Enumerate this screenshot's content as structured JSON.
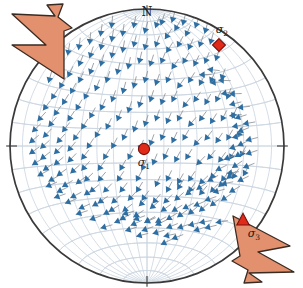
{
  "figure": {
    "type": "stereonet",
    "projection": "equal-area lower hemisphere",
    "background_color": "#ffffff",
    "title": ""
  },
  "net": {
    "center_x": 147,
    "center_y": 146,
    "radius": 137,
    "outline_color": "#3a3a3a",
    "grid_color": "#c9d4df",
    "grid_spacing_deg": 10,
    "fill_color": "#ffffff"
  },
  "orientation_labels": {
    "north": "N",
    "north_tick": true,
    "south_tick": true,
    "east_tick": true,
    "west_tick": true
  },
  "stress_axes": [
    {
      "id": "sigma1",
      "label": "σ",
      "subscript": "1",
      "marker": "circle",
      "color": "#e02b1a",
      "edge_color": "#7a1008",
      "x": 144,
      "y": 149,
      "size": 9,
      "label_x": 144,
      "label_y": 166
    },
    {
      "id": "sigma2",
      "label": "σ",
      "subscript": "2",
      "marker": "diamond",
      "color": "#e02b1a",
      "edge_color": "#7a1008",
      "x": 219,
      "y": 45,
      "size": 9,
      "label_x": 222,
      "label_y": 33
    },
    {
      "id": "sigma3",
      "label": "σ",
      "subscript": "3",
      "marker": "triangle",
      "color": "#e02b1a",
      "edge_color": "#7a1008",
      "x": 243,
      "y": 220,
      "size": 10,
      "label_x": 254,
      "label_y": 237
    }
  ],
  "extension_arrows": [
    {
      "id": "arrow-nw",
      "direction": "northwest",
      "fill_color": "#e2906d",
      "edge_color": "#3a2b22",
      "points": "64,79 12,45 46,45 12,14 55,16 47,5 63,4 58,17 72,28 64,31"
    },
    {
      "id": "arrow-se",
      "direction": "southeast",
      "fill_color": "#e2906d",
      "edge_color": "#3a2b22",
      "points": "233,216 290,246 258,252 294,272 249,273 262,282 244,283 248,270 232,261 240,256"
    }
  ],
  "slip_vectors": {
    "count": 252,
    "arrow_head_color": "#2d6ea3",
    "tail_color": "#8a8f96",
    "description": "Blue slip / displacement vectors on lower-hemisphere projection, radiating away from sigma-1 toward the NW and SE extension directions"
  },
  "chart_data": {
    "type": "scatter",
    "title": "",
    "xlabel": "",
    "ylabel": "",
    "grid": true,
    "legend": "none",
    "vectors": [
      [
        0.42,
        0.82,
        196
      ],
      [
        0.35,
        0.86,
        200
      ],
      [
        0.28,
        0.8,
        205
      ],
      [
        0.2,
        0.84,
        210
      ],
      [
        0.13,
        0.78,
        214
      ],
      [
        0.06,
        0.86,
        200
      ],
      [
        -0.02,
        0.82,
        196
      ],
      [
        -0.1,
        0.86,
        192
      ],
      [
        -0.18,
        0.8,
        188
      ],
      [
        -0.26,
        0.76,
        190
      ],
      [
        -0.34,
        0.7,
        194
      ],
      [
        -0.42,
        0.64,
        198
      ],
      [
        -0.5,
        0.58,
        202
      ],
      [
        -0.58,
        0.5,
        206
      ],
      [
        -0.64,
        0.42,
        210
      ],
      [
        -0.7,
        0.34,
        214
      ],
      [
        -0.76,
        0.26,
        218
      ],
      [
        -0.8,
        0.18,
        222
      ],
      [
        -0.84,
        0.1,
        226
      ],
      [
        -0.86,
        0.02,
        230
      ],
      [
        -0.86,
        -0.06,
        234
      ],
      [
        -0.84,
        -0.14,
        238
      ],
      [
        -0.8,
        -0.22,
        242
      ],
      [
        -0.74,
        -0.3,
        246
      ],
      [
        -0.68,
        -0.38,
        250
      ],
      [
        0.46,
        0.74,
        196
      ],
      [
        0.38,
        0.72,
        200
      ],
      [
        0.3,
        0.7,
        204
      ],
      [
        0.22,
        0.72,
        208
      ],
      [
        0.14,
        0.68,
        212
      ],
      [
        0.06,
        0.72,
        200
      ],
      [
        -0.02,
        0.7,
        196
      ],
      [
        -0.1,
        0.72,
        194
      ],
      [
        -0.18,
        0.68,
        190
      ],
      [
        -0.26,
        0.64,
        192
      ],
      [
        -0.34,
        0.58,
        196
      ],
      [
        -0.42,
        0.52,
        200
      ],
      [
        -0.5,
        0.46,
        204
      ],
      [
        -0.56,
        0.38,
        208
      ],
      [
        -0.62,
        0.3,
        212
      ],
      [
        -0.68,
        0.22,
        216
      ],
      [
        -0.72,
        0.14,
        220
      ],
      [
        -0.76,
        0.06,
        224
      ],
      [
        -0.78,
        -0.02,
        228
      ],
      [
        -0.78,
        -0.1,
        232
      ],
      [
        -0.76,
        -0.18,
        236
      ],
      [
        -0.72,
        -0.26,
        240
      ],
      [
        -0.66,
        -0.34,
        244
      ],
      [
        -0.6,
        -0.42,
        248
      ],
      [
        -0.52,
        -0.5,
        252
      ],
      [
        0.5,
        0.62,
        198
      ],
      [
        0.42,
        0.6,
        202
      ],
      [
        0.34,
        0.58,
        206
      ],
      [
        0.26,
        0.6,
        210
      ],
      [
        0.18,
        0.56,
        214
      ],
      [
        0.1,
        0.6,
        202
      ],
      [
        0.02,
        0.58,
        198
      ],
      [
        -0.06,
        0.6,
        194
      ],
      [
        -0.14,
        0.56,
        192
      ],
      [
        -0.22,
        0.52,
        194
      ],
      [
        -0.3,
        0.46,
        198
      ],
      [
        -0.38,
        0.4,
        202
      ],
      [
        -0.46,
        0.34,
        206
      ],
      [
        -0.52,
        0.26,
        210
      ],
      [
        -0.58,
        0.18,
        214
      ],
      [
        -0.62,
        0.1,
        218
      ],
      [
        -0.66,
        0.02,
        222
      ],
      [
        -0.68,
        -0.06,
        226
      ],
      [
        -0.68,
        -0.14,
        230
      ],
      [
        -0.66,
        -0.22,
        234
      ],
      [
        -0.62,
        -0.3,
        238
      ],
      [
        -0.56,
        -0.38,
        242
      ],
      [
        -0.5,
        -0.46,
        246
      ],
      [
        -0.42,
        -0.54,
        250
      ],
      [
        -0.34,
        -0.6,
        254
      ],
      [
        0.54,
        0.48,
        200
      ],
      [
        0.46,
        0.46,
        204
      ],
      [
        0.38,
        0.44,
        208
      ],
      [
        0.3,
        0.46,
        212
      ],
      [
        0.22,
        0.42,
        216
      ],
      [
        0.14,
        0.46,
        204
      ],
      [
        0.06,
        0.44,
        200
      ],
      [
        -0.02,
        0.46,
        196
      ],
      [
        -0.1,
        0.42,
        194
      ],
      [
        -0.18,
        0.38,
        196
      ],
      [
        -0.26,
        0.32,
        200
      ],
      [
        -0.34,
        0.26,
        204
      ],
      [
        -0.42,
        0.2,
        208
      ],
      [
        -0.48,
        0.12,
        212
      ],
      [
        -0.54,
        0.04,
        216
      ],
      [
        -0.58,
        -0.04,
        220
      ],
      [
        -0.58,
        -0.12,
        224
      ],
      [
        -0.56,
        -0.2,
        228
      ],
      [
        -0.52,
        -0.28,
        232
      ],
      [
        -0.46,
        -0.36,
        236
      ],
      [
        -0.4,
        -0.44,
        240
      ],
      [
        -0.32,
        -0.5,
        244
      ],
      [
        -0.24,
        -0.56,
        248
      ],
      [
        -0.16,
        -0.62,
        252
      ],
      [
        -0.08,
        -0.66,
        256
      ],
      [
        0.58,
        0.34,
        202
      ],
      [
        0.5,
        0.32,
        206
      ],
      [
        0.42,
        0.3,
        210
      ],
      [
        0.34,
        0.32,
        214
      ],
      [
        0.26,
        0.28,
        218
      ],
      [
        0.18,
        0.32,
        206
      ],
      [
        0.1,
        0.3,
        202
      ],
      [
        0.02,
        0.32,
        198
      ],
      [
        -0.06,
        0.28,
        196
      ],
      [
        -0.14,
        0.24,
        198
      ],
      [
        -0.22,
        0.18,
        202
      ],
      [
        -0.3,
        0.12,
        206
      ],
      [
        -0.38,
        0.06,
        210
      ],
      [
        -0.44,
        -0.02,
        214
      ],
      [
        -0.48,
        -0.1,
        218
      ],
      [
        -0.48,
        -0.18,
        222
      ],
      [
        -0.46,
        -0.26,
        226
      ],
      [
        -0.42,
        -0.34,
        230
      ],
      [
        -0.36,
        -0.42,
        234
      ],
      [
        -0.28,
        -0.48,
        238
      ],
      [
        -0.2,
        -0.54,
        242
      ],
      [
        -0.12,
        -0.58,
        246
      ],
      [
        -0.04,
        -0.62,
        250
      ],
      [
        0.04,
        -0.64,
        254
      ],
      [
        0.12,
        -0.66,
        258
      ],
      [
        0.62,
        0.2,
        204
      ],
      [
        0.54,
        0.18,
        208
      ],
      [
        0.46,
        0.16,
        212
      ],
      [
        0.38,
        0.18,
        216
      ],
      [
        0.3,
        0.14,
        220
      ],
      [
        0.22,
        0.18,
        208
      ],
      [
        0.14,
        0.16,
        204
      ],
      [
        0.06,
        0.18,
        200
      ],
      [
        -0.02,
        0.14,
        198
      ],
      [
        -0.1,
        0.1,
        200
      ],
      [
        -0.18,
        0.04,
        204
      ],
      [
        -0.26,
        -0.02,
        208
      ],
      [
        -0.32,
        -0.1,
        212
      ],
      [
        -0.36,
        -0.18,
        216
      ],
      [
        -0.36,
        -0.26,
        220
      ],
      [
        -0.32,
        -0.34,
        224
      ],
      [
        -0.26,
        -0.42,
        228
      ],
      [
        -0.18,
        -0.48,
        232
      ],
      [
        -0.1,
        -0.52,
        236
      ],
      [
        -0.02,
        -0.56,
        240
      ],
      [
        0.06,
        -0.58,
        244
      ],
      [
        0.14,
        -0.6,
        248
      ],
      [
        0.22,
        -0.6,
        252
      ],
      [
        0.3,
        -0.58,
        256
      ],
      [
        0.38,
        -0.56,
        260
      ],
      [
        0.66,
        0.06,
        206
      ],
      [
        0.58,
        0.04,
        210
      ],
      [
        0.5,
        0.02,
        214
      ],
      [
        0.42,
        0.04,
        218
      ],
      [
        0.34,
        0.0,
        222
      ],
      [
        0.26,
        0.04,
        210
      ],
      [
        0.18,
        0.02,
        206
      ],
      [
        0.1,
        0.04,
        202
      ],
      [
        0.02,
        0.0,
        200
      ],
      [
        -0.06,
        -0.04,
        202
      ],
      [
        -0.14,
        -0.1,
        206
      ],
      [
        -0.2,
        -0.18,
        210
      ],
      [
        -0.22,
        -0.26,
        214
      ],
      [
        -0.2,
        -0.34,
        218
      ],
      [
        -0.14,
        -0.4,
        222
      ],
      [
        -0.06,
        -0.44,
        226
      ],
      [
        0.02,
        -0.46,
        230
      ],
      [
        0.1,
        -0.48,
        234
      ],
      [
        0.18,
        -0.48,
        238
      ],
      [
        0.26,
        -0.46,
        242
      ],
      [
        0.34,
        -0.44,
        246
      ],
      [
        0.42,
        -0.4,
        250
      ],
      [
        0.48,
        -0.34,
        254
      ],
      [
        0.54,
        -0.28,
        258
      ],
      [
        0.58,
        -0.2,
        262
      ],
      [
        0.68,
        -0.08,
        208
      ],
      [
        0.6,
        -0.1,
        212
      ],
      [
        0.52,
        -0.12,
        216
      ],
      [
        0.44,
        -0.1,
        220
      ],
      [
        0.36,
        -0.14,
        224
      ],
      [
        0.28,
        -0.1,
        212
      ],
      [
        0.2,
        -0.12,
        208
      ],
      [
        0.12,
        -0.1,
        204
      ],
      [
        0.04,
        -0.14,
        202
      ],
      [
        -0.04,
        -0.18,
        204
      ],
      [
        -0.08,
        -0.26,
        208
      ],
      [
        -0.08,
        -0.34,
        212
      ],
      [
        -0.04,
        -0.4,
        216
      ],
      [
        0.04,
        -0.42,
        220
      ],
      [
        0.12,
        -0.42,
        224
      ],
      [
        0.2,
        -0.4,
        228
      ],
      [
        0.28,
        -0.36,
        232
      ],
      [
        0.36,
        -0.32,
        236
      ],
      [
        0.44,
        -0.26,
        240
      ],
      [
        0.5,
        -0.18,
        244
      ],
      [
        0.56,
        -0.1,
        248
      ],
      [
        0.6,
        -0.02,
        252
      ],
      [
        0.62,
        0.06,
        256
      ],
      [
        0.62,
        0.14,
        260
      ],
      [
        0.6,
        0.22,
        264
      ],
      [
        0.7,
        -0.22,
        210
      ],
      [
        0.62,
        -0.24,
        214
      ],
      [
        0.54,
        -0.26,
        218
      ],
      [
        0.46,
        -0.24,
        222
      ],
      [
        0.38,
        -0.28,
        226
      ],
      [
        0.3,
        -0.26,
        214
      ],
      [
        0.22,
        -0.28,
        210
      ],
      [
        0.14,
        -0.26,
        206
      ],
      [
        0.06,
        -0.3,
        204
      ],
      [
        0.14,
        -0.34,
        208
      ],
      [
        0.22,
        -0.32,
        212
      ],
      [
        0.3,
        -0.34,
        216
      ],
      [
        0.38,
        -0.36,
        220
      ],
      [
        0.46,
        -0.34,
        224
      ],
      [
        0.52,
        -0.3,
        228
      ],
      [
        0.58,
        -0.24,
        232
      ],
      [
        0.62,
        -0.16,
        236
      ],
      [
        0.64,
        -0.08,
        240
      ],
      [
        0.66,
        0.0,
        244
      ],
      [
        0.66,
        0.1,
        248
      ],
      [
        0.64,
        0.2,
        252
      ],
      [
        0.6,
        0.3,
        256
      ],
      [
        0.54,
        0.38,
        260
      ],
      [
        0.46,
        0.46,
        264
      ],
      [
        0.38,
        0.52,
        268
      ],
      [
        0.3,
        -0.5,
        230
      ],
      [
        0.22,
        -0.52,
        234
      ],
      [
        0.14,
        -0.54,
        238
      ],
      [
        0.06,
        -0.56,
        242
      ],
      [
        -0.02,
        -0.56,
        246
      ],
      [
        -0.1,
        -0.54,
        250
      ],
      [
        -0.18,
        -0.5,
        254
      ],
      [
        0.38,
        -0.48,
        228
      ],
      [
        0.46,
        -0.44,
        232
      ],
      [
        0.54,
        -0.4,
        236
      ],
      [
        0.6,
        -0.34,
        240
      ],
      [
        0.66,
        -0.26,
        244
      ],
      [
        0.7,
        -0.16,
        248
      ],
      [
        0.72,
        -0.06,
        252
      ],
      [
        0.72,
        0.04,
        256
      ],
      [
        0.7,
        0.16,
        260
      ],
      [
        0.66,
        0.28,
        264
      ],
      [
        0.6,
        0.38,
        268
      ],
      [
        0.52,
        0.48,
        272
      ],
      [
        0.44,
        0.56,
        276
      ],
      [
        -0.58,
        0.66,
        190
      ],
      [
        -0.5,
        0.7,
        188
      ],
      [
        -0.42,
        0.74,
        186
      ],
      [
        -0.66,
        0.56,
        192
      ],
      [
        -0.72,
        0.46,
        196
      ],
      [
        0.1,
        0.88,
        198
      ],
      [
        0.18,
        0.9,
        196
      ],
      [
        0.26,
        0.88,
        194
      ],
      [
        -0.34,
        0.8,
        188
      ],
      [
        -0.26,
        0.86,
        186
      ],
      [
        0.34,
        -0.62,
        252
      ],
      [
        0.42,
        -0.6,
        256
      ],
      [
        0.5,
        -0.56,
        260
      ],
      [
        0.18,
        -0.68,
        248
      ],
      [
        0.1,
        -0.72,
        244
      ]
    ]
  }
}
